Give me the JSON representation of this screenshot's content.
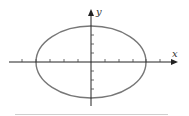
{
  "diagram": {
    "type": "ellipse-on-axes",
    "labels": {
      "x_axis": "x",
      "y_axis": "y"
    },
    "ellipse": {
      "center": [
        0,
        0
      ],
      "semi_major_x_ticks": 4,
      "semi_minor_y_ticks": 4,
      "stroke": "#777777"
    },
    "x_ticks": [
      -5,
      -4,
      -3,
      -2,
      -1,
      1,
      2,
      3,
      4,
      5
    ],
    "y_ticks": [
      -3,
      -2,
      -1,
      1,
      2,
      3
    ],
    "axis_color": "#222222",
    "rule_color": "#cfcfcf"
  }
}
